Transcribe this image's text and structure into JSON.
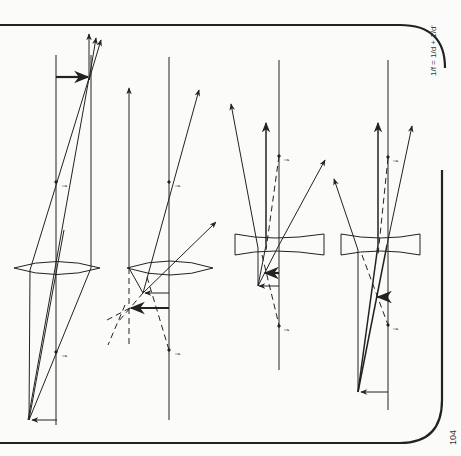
{
  "page": {
    "page_number": "104",
    "formula": "1/f = 1/d + 1/d'",
    "side_caption": "(rotated caption, cut off at left edge — illegible)",
    "focal_label": "f"
  },
  "diagrams": [
    {
      "id": "converging-real-image",
      "lens": "converging",
      "image": "real, inverted"
    },
    {
      "id": "converging-virtual-image",
      "lens": "converging",
      "image": "virtual"
    },
    {
      "id": "diverging-object-outside-focus",
      "lens": "diverging",
      "image": "virtual, reduced"
    },
    {
      "id": "diverging-object-far",
      "lens": "diverging",
      "image": "virtual, reduced"
    }
  ],
  "colors": {
    "ink": "#222222",
    "paper": "#fbfbfa"
  }
}
